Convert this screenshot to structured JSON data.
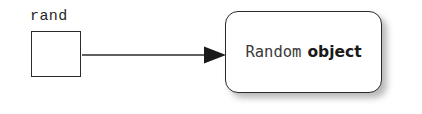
{
  "diagram": {
    "background_color": "#ffffff",
    "stroke_color": "#2b2b2b",
    "variable": {
      "label": "rand",
      "box_fill": "#ffffff",
      "box_contents": ""
    },
    "arrow": {
      "name": "reference-arrow",
      "style": "solid-line-filled-triangle-head",
      "color": "#2b2b2b",
      "from": "rand",
      "to": "Random object"
    },
    "object": {
      "type_name": "Random",
      "kind_label": "object",
      "fill": "#ffffff",
      "shadow_color": "#5a5a5a"
    }
  }
}
